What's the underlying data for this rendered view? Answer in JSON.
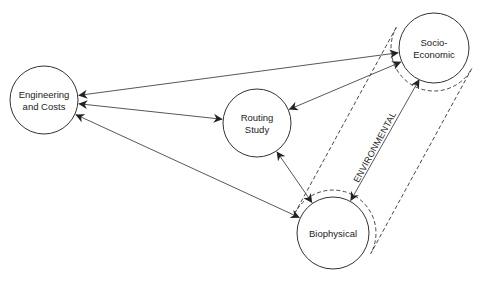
{
  "diagram": {
    "type": "relationship diagram",
    "nodes": [
      {
        "id": "engineering",
        "lines": [
          "Engineering",
          "and Costs"
        ],
        "cx": 44,
        "cy": 100,
        "r": 34
      },
      {
        "id": "routing",
        "lines": [
          "Routing",
          "Study"
        ],
        "cx": 257,
        "cy": 123,
        "r": 34
      },
      {
        "id": "socio",
        "lines": [
          "Socio-",
          "Economic"
        ],
        "cx": 434,
        "cy": 48,
        "r": 35
      },
      {
        "id": "bio",
        "lines": [
          "Biophysical"
        ],
        "cx": 333,
        "cy": 233,
        "r": 36
      }
    ],
    "edges": [
      {
        "from": "engineering",
        "to": "socio",
        "arrows": "both"
      },
      {
        "from": "engineering",
        "to": "routing",
        "arrows": "both"
      },
      {
        "from": "engineering",
        "to": "bio",
        "arrows": "both"
      },
      {
        "from": "routing",
        "to": "socio",
        "arrows": "both"
      },
      {
        "from": "routing",
        "to": "bio",
        "arrows": "both"
      },
      {
        "from": "socio",
        "to": "bio",
        "arrows": "both",
        "label": "ENVIRONMENTAL"
      }
    ],
    "group": {
      "members": [
        "socio",
        "bio"
      ],
      "style": "dashed",
      "label": "ENVIRONMENTAL"
    }
  },
  "colors": {
    "stroke": "#333333",
    "text": "#222222",
    "background": "#ffffff"
  }
}
